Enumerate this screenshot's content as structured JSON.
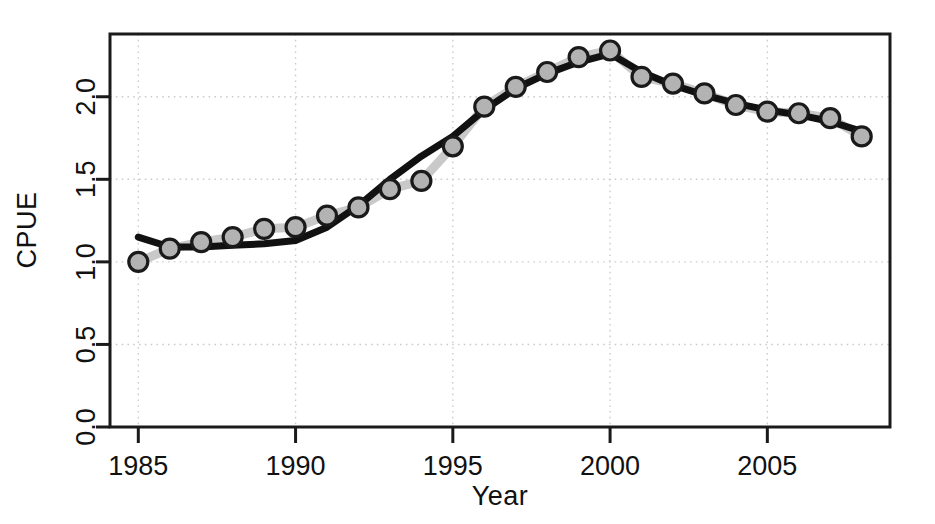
{
  "chart_data": {
    "type": "line",
    "title": "",
    "xlabel": "Year",
    "ylabel": "CPUE",
    "xlim": [
      1984.1,
      1108.0
    ],
    "x_axis": {
      "min": 1984.1,
      "max": 2008.9,
      "ticks": [
        1985,
        1990,
        1995,
        2000,
        2005
      ],
      "tick_labels": [
        "1985",
        "1990",
        "1995",
        "2000",
        "2005"
      ]
    },
    "y_axis": {
      "min": 0.0,
      "max": 2.38,
      "ticks": [
        0.0,
        0.5,
        1.0,
        1.5,
        2.0
      ],
      "tick_labels": [
        "0.0",
        "0.5",
        "1.0",
        "1.5",
        "2.0"
      ]
    },
    "grid": true,
    "legend": "none",
    "x": [
      1985,
      1986,
      1987,
      1988,
      1989,
      1990,
      1991,
      1992,
      1993,
      1994,
      1995,
      1996,
      1997,
      1998,
      1999,
      2000,
      2001,
      2002,
      2003,
      2004,
      2005,
      2006,
      2007,
      2008
    ],
    "categories": [
      "1985",
      "1986",
      "1987",
      "1988",
      "1989",
      "1990",
      "1991",
      "1992",
      "1993",
      "1994",
      "1995",
      "1996",
      "1997",
      "1998",
      "1999",
      "2000",
      "2001",
      "2002",
      "2003",
      "2004",
      "2005",
      "2006",
      "2007",
      "2008"
    ],
    "series": [
      {
        "name": "observed",
        "style": "light-grey-line-with-open-circle-markers",
        "color": "#c9c9c9",
        "marker_color": "#b3b3b3",
        "marker_edge_color": "#1a1a1a",
        "values": [
          1.0,
          1.08,
          1.12,
          1.15,
          1.2,
          1.21,
          1.28,
          1.33,
          1.44,
          1.49,
          1.7,
          1.94,
          2.06,
          2.15,
          2.24,
          2.28,
          2.12,
          2.08,
          2.02,
          1.95,
          1.91,
          1.9,
          1.87,
          1.76
        ]
      },
      {
        "name": "fitted",
        "style": "thick-black-line",
        "color": "#111111",
        "values": [
          1.15,
          1.09,
          1.09,
          1.1,
          1.11,
          1.13,
          1.21,
          1.34,
          1.5,
          1.64,
          1.76,
          1.92,
          2.05,
          2.14,
          2.21,
          2.26,
          2.15,
          2.07,
          2.01,
          1.96,
          1.92,
          1.89,
          1.85,
          1.79
        ]
      }
    ]
  },
  "axis_labels": {
    "x_title": "Year",
    "y_title": "CPUE"
  },
  "ticks": {
    "y": [
      "0.0",
      "0.5",
      "1.0",
      "1.5",
      "2.0"
    ],
    "x": [
      "1985",
      "1990",
      "1995",
      "2000",
      "2005"
    ]
  }
}
